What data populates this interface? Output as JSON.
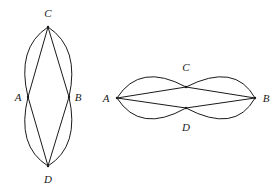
{
  "figures": [
    {
      "id": "vertical",
      "points": {
        "C": {
          "x": 48,
          "y": 27,
          "label": "C",
          "lx": 48,
          "ly": 17
        },
        "A": {
          "x": 28,
          "y": 97,
          "label": "A",
          "lx": 18,
          "ly": 101
        },
        "B": {
          "x": 69,
          "y": 97,
          "label": "B",
          "lx": 78,
          "ly": 101
        },
        "D": {
          "x": 48,
          "y": 166,
          "label": "D",
          "lx": 48,
          "ly": 183
        }
      },
      "straight_edges": [
        [
          "C",
          "A"
        ],
        [
          "C",
          "B"
        ],
        [
          "A",
          "D"
        ],
        [
          "B",
          "D"
        ]
      ],
      "curved_edges": [
        {
          "from": "C",
          "to": "A",
          "ctrl": [
            16,
            48
          ]
        },
        {
          "from": "C",
          "to": "B",
          "ctrl": [
            80,
            48
          ]
        },
        {
          "from": "A",
          "to": "D",
          "ctrl": [
            16,
            146
          ]
        },
        {
          "from": "B",
          "to": "D",
          "ctrl": [
            80,
            146
          ]
        }
      ]
    },
    {
      "id": "horizontal",
      "points": {
        "A": {
          "x": 117,
          "y": 98,
          "label": "A",
          "lx": 106,
          "ly": 102
        },
        "B": {
          "x": 255,
          "y": 98,
          "label": "B",
          "lx": 266,
          "ly": 102
        },
        "C": {
          "x": 186,
          "y": 87,
          "label": "C",
          "lx": 186,
          "ly": 71
        },
        "D": {
          "x": 186,
          "y": 108,
          "label": "D",
          "lx": 186,
          "ly": 131
        }
      },
      "straight_edges": [
        [
          "A",
          "C"
        ],
        [
          "C",
          "B"
        ],
        [
          "A",
          "D"
        ],
        [
          "D",
          "B"
        ]
      ],
      "curved_edges": [
        {
          "from": "A",
          "to": "C",
          "ctrl": [
            140,
            62
          ]
        },
        {
          "from": "C",
          "to": "B",
          "ctrl": [
            235,
            62
          ]
        },
        {
          "from": "A",
          "to": "D",
          "ctrl": [
            140,
            134
          ]
        },
        {
          "from": "D",
          "to": "B",
          "ctrl": [
            235,
            134
          ]
        }
      ]
    }
  ]
}
